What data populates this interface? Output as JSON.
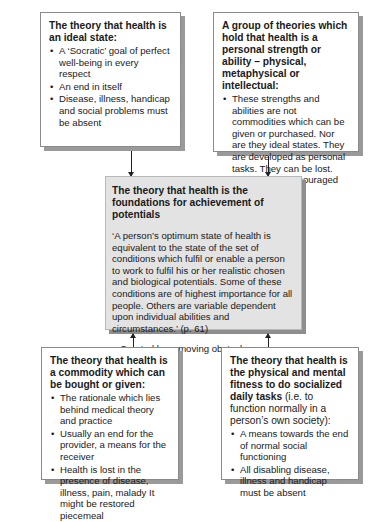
{
  "diagram": {
    "top_left": {
      "title": "The theory that health is an ideal state:",
      "bullets": [
        "A ‘Socratic’ goal of perfect well-being in every respect",
        "An end in itself",
        "Disease, illness, handicap and social problems must be absent"
      ]
    },
    "top_right": {
      "title": "A group of theories which hold that health is a personal strength or ability – physical, metaphysical or intellectual:",
      "bullets": [
        "These strengths and abilities are not commodities which can be given or purchased. Nor are they ideal states. They are developed as personal tasks. They can be lost. They can be encouraged"
      ]
    },
    "center": {
      "title": "The theory that health is the foundations for achievement of potentials",
      "quote": "‘A person’s optimum state of health is equivalent to the state of the set of conditions which fulfil or enable a person to work to fulfil his or her realistic chosen and biological potentials. Some of these conditions are of highest importance for all people. Others are variable dependent upon individual abilities and circumstances.’ (p. 61)",
      "note": "– Created by removing obstacles."
    },
    "bottom_left": {
      "title": "The theory that health is a commodity which can be bought or given:",
      "bullets": [
        "The rationale which lies behind medical theory and practice",
        "Usually an end for the provider, a means for the receiver",
        "Health is lost in the presence of disease, illness, pain, malady It might be restored piecemeal"
      ]
    },
    "bottom_right": {
      "title": "The theory that health is the physical and mental fitness to do socialized daily tasks",
      "title_suffix": " (i.e. to function normally in a person’s own society):",
      "bullets": [
        "A means towards the end of normal social functioning",
        "All disabling disease, illness and handicap must be absent"
      ]
    },
    "bullet_glyph": "•",
    "colors": {
      "box_border": "#8a8a8a",
      "shadow": "#9a9a9a",
      "center_fill": "#e3e3e3",
      "arrow": "#222222"
    }
  }
}
